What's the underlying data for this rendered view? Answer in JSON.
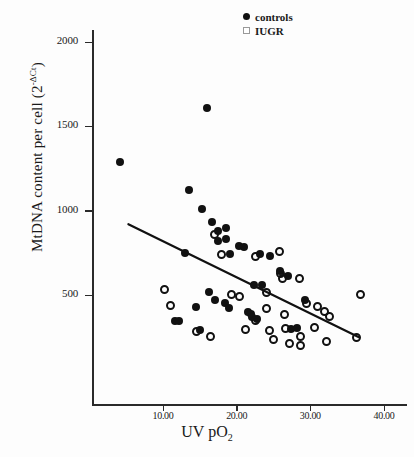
{
  "chart_data": {
    "type": "scatter",
    "title": "",
    "xlabel": "UV pO2",
    "ylabel": "MtDNA content per cell (2-ΔCt)",
    "xlim": [
      0,
      42
    ],
    "ylim": [
      0,
      2150
    ],
    "grid": false,
    "legend_position": "top-right",
    "xticks": [
      "10.00",
      "20.00",
      "30.00",
      "40.00"
    ],
    "xtick_values": [
      10,
      20,
      30,
      40
    ],
    "yticks": [
      "500",
      "1000",
      "1500",
      "2000"
    ],
    "ytick_values": [
      500,
      1000,
      1500,
      2000
    ],
    "series": [
      {
        "name": "controls",
        "marker": "filled-circle",
        "color": "#111111",
        "points": [
          [
            4.2,
            1290
          ],
          [
            16.0,
            1610
          ],
          [
            13.5,
            1120
          ],
          [
            15.3,
            1010
          ],
          [
            16.6,
            930
          ],
          [
            17.4,
            880
          ],
          [
            17.5,
            820
          ],
          [
            18.5,
            900
          ],
          [
            18.6,
            830
          ],
          [
            19.1,
            745
          ],
          [
            20.3,
            790
          ],
          [
            21.0,
            785
          ],
          [
            13.0,
            750
          ],
          [
            14.5,
            430
          ],
          [
            16.2,
            520
          ],
          [
            17.0,
            470
          ],
          [
            18.4,
            450
          ],
          [
            19.0,
            420
          ],
          [
            21.5,
            400
          ],
          [
            22.0,
            390
          ],
          [
            22.4,
            560
          ],
          [
            23.5,
            560
          ],
          [
            22.1,
            370
          ],
          [
            22.8,
            360
          ],
          [
            27.4,
            300
          ],
          [
            28.2,
            305
          ],
          [
            25.9,
            640
          ],
          [
            27.0,
            610
          ],
          [
            29.3,
            470
          ],
          [
            11.6,
            345
          ],
          [
            12.2,
            345
          ],
          [
            15.0,
            295
          ],
          [
            24.5,
            730
          ],
          [
            23.2,
            745
          ]
        ]
      },
      {
        "name": "IUGR",
        "marker": "open-circle",
        "color": "#111111",
        "points": [
          [
            17.0,
            860
          ],
          [
            18.0,
            740
          ],
          [
            22.6,
            730
          ],
          [
            25.8,
            755
          ],
          [
            25.9,
            630
          ],
          [
            10.2,
            535
          ],
          [
            11.0,
            440
          ],
          [
            19.3,
            505
          ],
          [
            20.4,
            490
          ],
          [
            24.0,
            515
          ],
          [
            26.2,
            600
          ],
          [
            28.5,
            600
          ],
          [
            29.5,
            450
          ],
          [
            31.0,
            430
          ],
          [
            26.5,
            385
          ],
          [
            22.6,
            350
          ],
          [
            24.0,
            420
          ],
          [
            31.9,
            400
          ],
          [
            32.6,
            375
          ],
          [
            36.8,
            505
          ],
          [
            16.5,
            255
          ],
          [
            25.0,
            235
          ],
          [
            26.6,
            300
          ],
          [
            27.2,
            215
          ],
          [
            28.6,
            255
          ],
          [
            28.7,
            200
          ],
          [
            32.2,
            225
          ],
          [
            36.3,
            250
          ],
          [
            21.2,
            295
          ],
          [
            14.6,
            285
          ],
          [
            24.4,
            290
          ],
          [
            30.5,
            310
          ]
        ]
      }
    ],
    "fit_line": {
      "x_start": 5.3,
      "y_start": 920,
      "x_end": 36.6,
      "y_end": 250,
      "color": "#111111",
      "width": 2.2
    }
  },
  "legend": {
    "entries": [
      {
        "label": "controls",
        "marker": "filled-circle"
      },
      {
        "label": "IUGR",
        "marker": "open-square"
      }
    ]
  },
  "axes": {
    "y_title_main": "MtDNA content per cell (2",
    "y_title_sup": "-ΔCt",
    "y_title_end": ")",
    "x_title_main": "UV pO",
    "x_title_sub": "2"
  }
}
